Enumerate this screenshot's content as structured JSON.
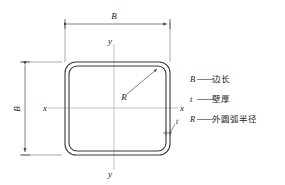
{
  "figure": {
    "colors": {
      "outline": "#3a3a3a",
      "dimension": "#4a4a4a",
      "axis": "#8a8a8a",
      "background": "#ffffff"
    },
    "dimensions": {
      "top_label": "B",
      "left_label": "B",
      "radius_label": "R",
      "thickness_label": "t"
    },
    "axes": {
      "y_top_label": "y",
      "y_bottom_label": "y",
      "x_left_label": "x",
      "x_right_label": "x"
    }
  },
  "legend": {
    "separator": "——",
    "items": [
      {
        "symbol": "B",
        "description": "边长"
      },
      {
        "symbol": "t",
        "description": "壁厚"
      },
      {
        "symbol": "R",
        "description": "外圆弧半径"
      }
    ]
  }
}
